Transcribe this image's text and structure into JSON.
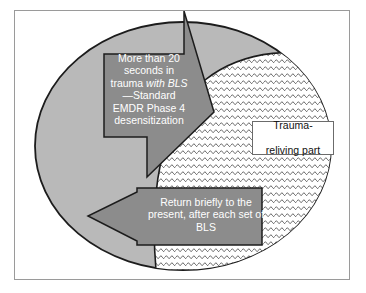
{
  "diagram": {
    "title_text_left": "Part that is oriented to the safety of the present",
    "left_region_lines": [
      "Part that",
      "is oriented",
      "to the",
      "safety of",
      "the",
      "present"
    ],
    "top_arrow": {
      "line1": "More than 20",
      "line2": "seconds in",
      "line3_prefix": "trauma ",
      "line3_italic": "with BLS",
      "line4": "—Standard",
      "line5": "EMDR  Phase 4",
      "line6": "desensitization"
    },
    "bottom_arrow": {
      "line1": "Return briefly to the",
      "line2": "present, after each set of",
      "line3": "BLS"
    },
    "callout_box": {
      "line1": "Trauma-",
      "line2": "reliving part"
    },
    "colors": {
      "ellipse_fill": "#b9b9b9",
      "arrow_fill": "#8c8c8c",
      "outline": "#1c1c1c",
      "frame_border": "#9a9a9a",
      "hatch_line": "#4a4a4a",
      "hatch_bg": "#ffffff",
      "text_on_arrow": "#ffffff",
      "text_in_box": "#111111",
      "page_bg": "#ffffff"
    },
    "shapes": {
      "outer_ellipse": "cycle-of-trauma-processing",
      "inner_hatched_region": "trauma-reliving-part-region",
      "arrow_into_trauma": "enter-trauma-arrow",
      "arrow_back_to_present": "return-to-present-arrow"
    }
  }
}
